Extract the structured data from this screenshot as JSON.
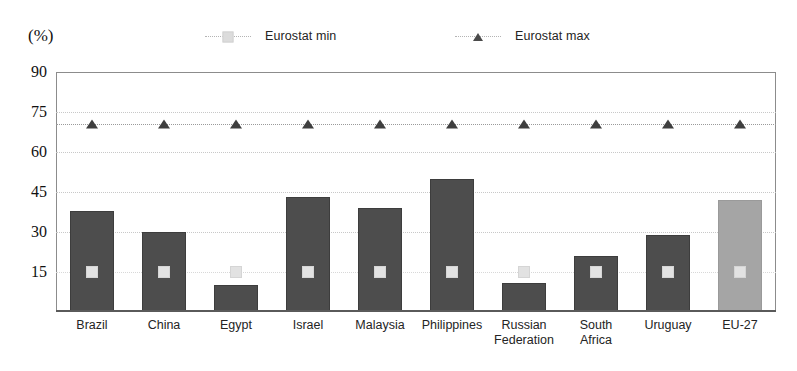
{
  "unit_label": "(%)",
  "legend": {
    "position": "top",
    "entries": [
      {
        "label": "Eurostat min",
        "marker": "square-marker",
        "color": "#dcdcdc"
      },
      {
        "label": "Eurostat max",
        "marker": "triangle-marker",
        "color": "#4a4a4a"
      }
    ]
  },
  "chart_data": {
    "type": "bar",
    "title": "",
    "subtitle": "",
    "xlabel": "",
    "ylabel": "(%)",
    "ylim": [
      0,
      90
    ],
    "yticks": [
      90,
      75,
      60,
      45,
      30,
      15
    ],
    "grid": true,
    "categories": [
      "Brazil",
      "China",
      "Egypt",
      "Israel",
      "Malaysia",
      "Philippines",
      "Russian\nFederation",
      "South\nAfrica",
      "Uruguay",
      "EU-27"
    ],
    "values": [
      38,
      30,
      10,
      43,
      39,
      50,
      11,
      21,
      29,
      42
    ],
    "bar_colors": [
      "#4d4d4d",
      "#4d4d4d",
      "#4d4d4d",
      "#4d4d4d",
      "#4d4d4d",
      "#4d4d4d",
      "#4d4d4d",
      "#4d4d4d",
      "#4d4d4d",
      "#a5a5a5"
    ],
    "series": [
      {
        "name": "Eurostat min",
        "marker": "square",
        "color": "#dcdcdc",
        "values": [
          15,
          15,
          15,
          15,
          15,
          15,
          15,
          15,
          15,
          15
        ]
      },
      {
        "name": "Eurostat max",
        "marker": "triangle",
        "color": "#3f3f3f",
        "values": [
          70.5,
          70.5,
          70.5,
          70.5,
          70.5,
          70.5,
          70.5,
          70.5,
          70.5,
          70.5
        ]
      }
    ]
  }
}
